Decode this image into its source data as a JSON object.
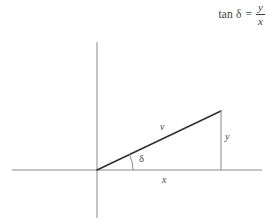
{
  "figure": {
    "type": "vector-component-diagram",
    "background_color": "#ffffff",
    "line_color": "#7a7a7a",
    "vector_color": "#3a3a3a",
    "text_color": "#4a4a4a"
  },
  "equation": {
    "function_name": "tan",
    "angle_symbol": "δ",
    "equals": "=",
    "numerator": "y",
    "denominator": "x",
    "plain_text": "tan δ = y/x"
  },
  "diagram": {
    "axes": {
      "horizontal_axis_name": "horizontal-axis",
      "vertical_axis_name": "vertical-axis",
      "origin_x": 97,
      "origin_y": 170,
      "h_axis_start_x": 12,
      "h_axis_end_x": 262,
      "v_axis_top_y": 42,
      "v_axis_bottom_y": 218
    },
    "vector": {
      "label": "v",
      "tip_x": 221,
      "tip_y": 111,
      "label_x": 160,
      "label_y": 122
    },
    "component_x": {
      "label": "x",
      "label_x": 162,
      "label_y": 175
    },
    "component_y": {
      "label": "y",
      "from_y": 111,
      "to_y": 170,
      "at_x": 221,
      "label_x": 225,
      "label_y": 132
    },
    "angle": {
      "label": "δ",
      "label_x": 139,
      "label_y": 154,
      "arc_radius": 36
    }
  }
}
